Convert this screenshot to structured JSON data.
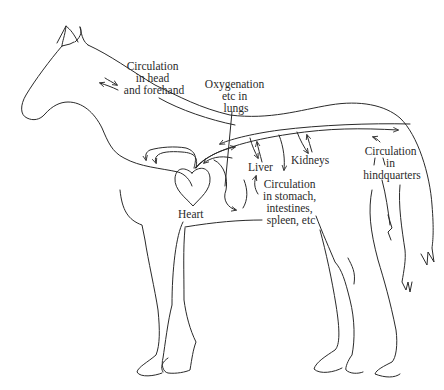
{
  "diagram": {
    "labels": {
      "head": [
        "Circulation",
        "in head",
        "and forehand"
      ],
      "lungs": [
        "Oxygenation",
        "etc in",
        "lungs"
      ],
      "heart": "Heart",
      "liver": "Liver",
      "kidneys": "Kidneys",
      "hindquarters": [
        "Circulation",
        "in",
        "hindquarters"
      ],
      "abdomen": [
        "Circulation",
        "in stomach,",
        "intestines,",
        "spleen, etc"
      ]
    },
    "colors": {
      "line": "#2a2a2a",
      "background": "#ffffff"
    }
  }
}
